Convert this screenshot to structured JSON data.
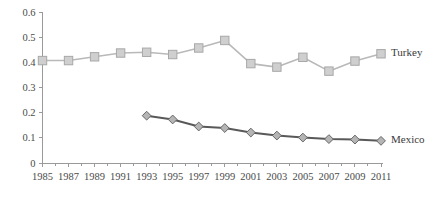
{
  "chart_data": {
    "type": "line",
    "title": "",
    "subtitle": "",
    "xlabel": "",
    "ylabel": "",
    "xlim": [
      1985,
      2011
    ],
    "ylim": [
      0,
      0.6
    ],
    "grid": false,
    "legend_position": "line-end-labels",
    "x": [
      1985,
      1986,
      1987,
      1988,
      1989,
      1990,
      1991,
      1992,
      1993,
      1994,
      1995,
      1996,
      1997,
      1998,
      1999,
      2000,
      2001,
      2002,
      2003,
      2004,
      2005,
      2006,
      2007,
      2008,
      2009,
      2010,
      2011
    ],
    "x_tick_labels": [
      "1985",
      "1987",
      "1989",
      "1991",
      "1993",
      "1995",
      "1997",
      "1999",
      "2001",
      "2003",
      "2005",
      "2007",
      "2009",
      "2011"
    ],
    "x_tick_values": [
      1985,
      1987,
      1989,
      1991,
      1993,
      1995,
      1997,
      1999,
      2001,
      2003,
      2005,
      2007,
      2009,
      2011
    ],
    "y_tick_labels": [
      "0",
      "0.1",
      "0.2",
      "0.3",
      "0.4",
      "0.5",
      "0.6"
    ],
    "y_tick_values": [
      0,
      0.1,
      0.2,
      0.3,
      0.4,
      0.5,
      0.6
    ],
    "series": [
      {
        "name": "Turkey",
        "color": "#b9b9b9",
        "marker": "square",
        "marker_fill": "#cfcfcf",
        "marker_stroke": "#a8a8a8",
        "x": [
          1985,
          1987,
          1989,
          1991,
          1993,
          1995,
          1997,
          1999,
          2001,
          2003,
          2005,
          2007,
          2009,
          2011
        ],
        "values": [
          0.407,
          0.407,
          0.422,
          0.437,
          0.44,
          0.431,
          0.457,
          0.487,
          0.395,
          0.381,
          0.42,
          0.365,
          0.405,
          0.434
        ]
      },
      {
        "name": "Mexico",
        "color": "#595959",
        "marker": "diamond",
        "marker_fill": "#b5b5b5",
        "marker_stroke": "#666666",
        "x": [
          1993,
          1995,
          1997,
          1999,
          2001,
          2003,
          2005,
          2007,
          2009,
          2011
        ],
        "values": [
          0.188,
          0.173,
          0.145,
          0.139,
          0.121,
          0.109,
          0.101,
          0.095,
          0.093,
          0.088
        ]
      }
    ]
  }
}
